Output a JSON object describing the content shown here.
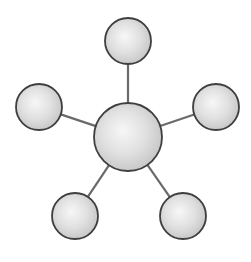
{
  "diagram": {
    "type": "hub-and-spoke",
    "colors": {
      "background": "#ffffff",
      "node_highlight": "#f7f7f7",
      "node_mid": "#e0e0e0",
      "node_edge": "#c4c4c4",
      "node_stroke": "#3f3f3f",
      "edge_stroke": "#6a6a6a"
    },
    "hub": {
      "id": "center",
      "cx": 128,
      "cy": 137,
      "r": 34
    },
    "satellites": [
      {
        "id": "top",
        "cx": 128,
        "cy": 41,
        "r": 23
      },
      {
        "id": "left",
        "cx": 39,
        "cy": 107,
        "r": 23
      },
      {
        "id": "right",
        "cx": 216,
        "cy": 107,
        "r": 23
      },
      {
        "id": "bottom-left",
        "cx": 75,
        "cy": 216,
        "r": 23
      },
      {
        "id": "bottom-right",
        "cx": 183,
        "cy": 216,
        "r": 23
      }
    ]
  }
}
